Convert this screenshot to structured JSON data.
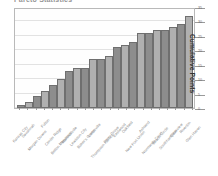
{
  "chart_data": {
    "type": "bar",
    "title": "Pareto Statistics",
    "xlabel": "",
    "ylabel": "Cumulative Points",
    "ylim": [
      0,
      35
    ],
    "yticks": [
      0,
      5,
      10,
      15,
      20,
      25,
      30,
      35
    ],
    "grid": true,
    "legend": "none",
    "categories": [
      "Kansas City",
      "Savannah",
      "Morgan Downs",
      "Fulton",
      "Center Ridge",
      "Belton Meadows",
      "Marshallville",
      "Lewiston City",
      "Baker's Green",
      "Lucasville",
      "Thompson Harbor",
      "Perry Grove",
      "Eastwood",
      "Oakfield",
      "New Port Union",
      "Ashland",
      "Normandy Court",
      "Beach Circle",
      "Southhampton",
      "Clearview",
      "Riverton",
      "Glen Haven"
    ],
    "values": [
      1,
      2,
      4,
      6,
      8,
      10,
      13,
      14,
      14,
      17,
      17,
      18,
      21,
      22,
      23,
      26,
      26,
      27,
      27,
      28,
      29,
      32
    ],
    "colors": {
      "bar_dark": "#8d8d8d",
      "bar_light": "#b0b0b0",
      "bar_border": "#6f6f6f",
      "gridline": "#e2e2e2",
      "frame": "#b9b9b9",
      "axis_text": "#6a6a6a",
      "label_text": "#8a8a8a"
    }
  }
}
